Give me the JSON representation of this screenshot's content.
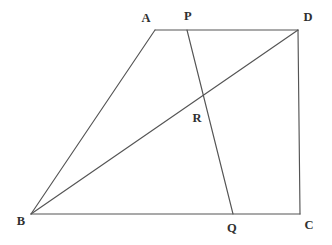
{
  "figure": {
    "kind": "geometry-diagram",
    "canvas": {
      "width": 332,
      "height": 245,
      "background": "#ffffff"
    },
    "style": {
      "stroke_color": "#545454",
      "stroke_width": 1.15,
      "label_color": "#303030",
      "label_font_size": 12.5
    },
    "points": [
      {
        "id": "A",
        "label": "A",
        "x": 155,
        "y": 30,
        "label_x": 146,
        "label_y": 18
      },
      {
        "id": "P",
        "label": "P",
        "x": 187,
        "y": 30,
        "label_x": 188,
        "label_y": 16
      },
      {
        "id": "D",
        "label": "D",
        "x": 298,
        "y": 30,
        "label_x": 308,
        "label_y": 17
      },
      {
        "id": "R",
        "label": "R",
        "x": 203,
        "y": 99,
        "label_x": 197,
        "label_y": 118
      },
      {
        "id": "B",
        "label": "B",
        "x": 31,
        "y": 214,
        "label_x": 21,
        "label_y": 221
      },
      {
        "id": "Q",
        "label": "Q",
        "x": 233,
        "y": 214,
        "label_x": 232,
        "label_y": 228
      },
      {
        "id": "C",
        "label": "C",
        "x": 300,
        "y": 214,
        "label_x": 309,
        "label_y": 225
      }
    ],
    "segments": [
      {
        "id": "AD",
        "name": "segment-ad",
        "x1": 155,
        "y1": 30,
        "x2": 298,
        "y2": 30
      },
      {
        "id": "AB",
        "name": "segment-ab",
        "x1": 155,
        "y1": 30,
        "x2": 31,
        "y2": 214
      },
      {
        "id": "BC",
        "name": "segment-bc",
        "x1": 31,
        "y1": 214,
        "x2": 300,
        "y2": 214
      },
      {
        "id": "DC",
        "name": "segment-dc",
        "x1": 298,
        "y1": 30,
        "x2": 300,
        "y2": 214
      },
      {
        "id": "BD",
        "name": "segment-bd-diagonal",
        "x1": 31,
        "y1": 214,
        "x2": 298,
        "y2": 30
      },
      {
        "id": "PQ",
        "name": "segment-pq-cevian",
        "x1": 187,
        "y1": 30,
        "x2": 233,
        "y2": 214
      }
    ]
  }
}
